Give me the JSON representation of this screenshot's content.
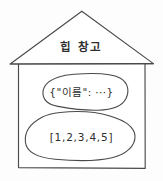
{
  "diagram": {
    "type": "hand-drawn-sketch",
    "title": "힙 창고",
    "container": {
      "shape": "house",
      "label": "힙 창고",
      "label_meaning": "heap storage"
    },
    "contents": [
      {
        "shape": "blob",
        "kind": "object",
        "label": "{\"이름\": ···}"
      },
      {
        "shape": "blob",
        "kind": "array",
        "label": "[1,2,3,4,5]"
      }
    ],
    "colors": {
      "background": "#fdfdfd",
      "stroke": "#4a4a4a",
      "text": "#2e2e2e",
      "fill": "#ffffff"
    }
  }
}
